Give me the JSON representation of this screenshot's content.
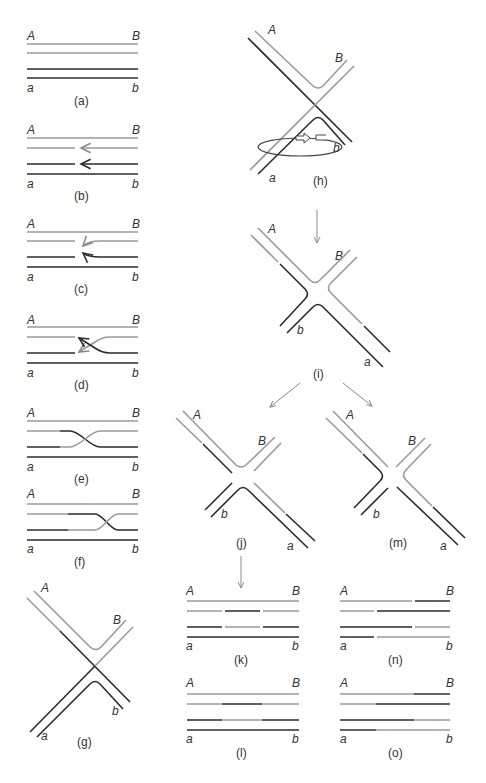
{
  "figure": {
    "colors": {
      "strand_upper": "#9a9a9a",
      "strand_lower": "#2b2b2b",
      "arrow": "#8a8a8a",
      "text": "#333333"
    },
    "panels": [
      {
        "id": "a",
        "caption": "(a)",
        "labels": {
          "top_left": "A",
          "top_right": "B",
          "bottom_left": "a",
          "bottom_right": "b"
        }
      },
      {
        "id": "b",
        "caption": "(b)",
        "labels": {
          "top_left": "A",
          "top_right": "B",
          "bottom_left": "a",
          "bottom_right": "b"
        }
      },
      {
        "id": "c",
        "caption": "(c)",
        "labels": {
          "top_left": "A",
          "top_right": "B",
          "bottom_left": "a",
          "bottom_right": "b"
        }
      },
      {
        "id": "d",
        "caption": "(d)",
        "labels": {
          "top_left": "A",
          "top_right": "B",
          "bottom_left": "a",
          "bottom_right": "b"
        }
      },
      {
        "id": "e",
        "caption": "(e)",
        "labels": {
          "top_left": "A",
          "top_right": "B",
          "bottom_left": "a",
          "bottom_right": "b"
        }
      },
      {
        "id": "f",
        "caption": "(f)",
        "labels": {
          "top_left": "A",
          "top_right": "B",
          "bottom_left": "a",
          "bottom_right": "b"
        }
      },
      {
        "id": "g",
        "caption": "(g)",
        "labels": {
          "top_left": "A",
          "top_right": "B",
          "bottom_left": "a",
          "bottom_right": "b"
        }
      },
      {
        "id": "h",
        "caption": "(h)",
        "labels": {
          "top_left": "A",
          "top_right": "B",
          "bottom_left": "a",
          "bottom_right": "b"
        }
      },
      {
        "id": "i",
        "caption": "(i)",
        "labels": {
          "top_left": "A",
          "top_right": "B",
          "bottom_left": "b",
          "bottom_right": "a"
        }
      },
      {
        "id": "j",
        "caption": "(j)",
        "labels": {
          "top_left": "A",
          "top_right": "B",
          "bottom_left": "b",
          "bottom_right": "a"
        }
      },
      {
        "id": "m",
        "caption": "(m)",
        "labels": {
          "top_left": "A",
          "top_right": "B",
          "bottom_left": "b",
          "bottom_right": "a"
        }
      },
      {
        "id": "k",
        "caption": "(k)",
        "labels": {
          "top_left": "A",
          "top_right": "B",
          "bottom_left": "a",
          "bottom_right": "b"
        }
      },
      {
        "id": "n",
        "caption": "(n)",
        "labels": {
          "top_left": "A",
          "top_right": "B",
          "bottom_left": "a",
          "bottom_right": "b"
        }
      },
      {
        "id": "l",
        "caption": "(l)",
        "labels": {
          "top_left": "A",
          "top_right": "B",
          "bottom_left": "a",
          "bottom_right": "b"
        }
      },
      {
        "id": "o",
        "caption": "(o)",
        "labels": {
          "top_left": "A",
          "top_right": "B",
          "bottom_left": "a",
          "bottom_right": "b"
        }
      }
    ]
  }
}
